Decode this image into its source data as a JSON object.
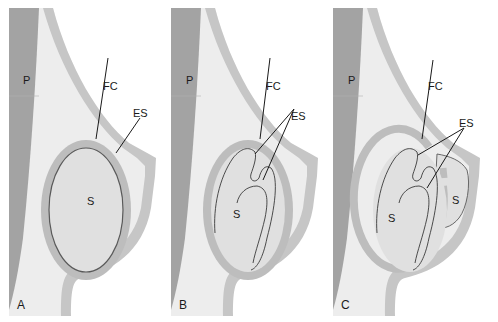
{
  "figure": {
    "colors": {
      "background": "#ffffff",
      "muscle": "#a3a3a3",
      "breast_tissue": "#ededed",
      "skin_band": "#c6c6c6",
      "capsule_band": "#bdbdbd",
      "implant_fill": "#e0e0e0",
      "outline": "#5a5a5a",
      "text": "#1a1a1a"
    },
    "panels": [
      {
        "id": "A",
        "panel_label": "A",
        "labels": {
          "muscle": "P",
          "capsule": "FC",
          "shell": "ES",
          "silicone": "S"
        },
        "state": "intact implant"
      },
      {
        "id": "B",
        "panel_label": "B",
        "labels": {
          "muscle": "P",
          "capsule": "FC",
          "shell": "ES",
          "silicone": "S"
        },
        "state": "intracapsular rupture - collapsed shell folds within capsule"
      },
      {
        "id": "C",
        "panel_label": "C",
        "labels": {
          "muscle": "P",
          "capsule": "FC",
          "shell": "ES",
          "silicone": "S",
          "silicone_extracapsular": "S"
        },
        "state": "extracapsular rupture - silicone escapes through capsule defect"
      }
    ]
  }
}
